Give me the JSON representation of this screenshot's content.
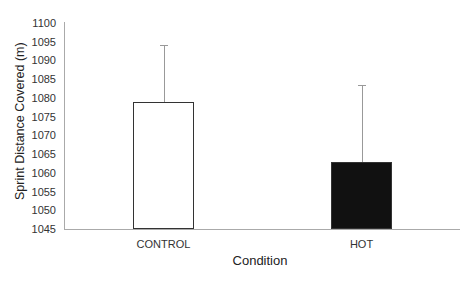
{
  "chart_data": {
    "type": "bar",
    "title": "",
    "xlabel": "Condition",
    "ylabel": "Sprint Distance Covered (m)",
    "categories": [
      "CONTROL",
      "HOT"
    ],
    "values": [
      1079,
      1063
    ],
    "error_upper": [
      15,
      20.5
    ],
    "bar_colors": [
      "#ffffff",
      "#111111"
    ],
    "ylim": [
      1045,
      1100
    ],
    "yticks": [
      "1100",
      "1095",
      "1090",
      "1085",
      "1080",
      "1075",
      "1070",
      "1065",
      "1060",
      "1055",
      "1050",
      "1045"
    ],
    "grid": false,
    "legend": null
  }
}
